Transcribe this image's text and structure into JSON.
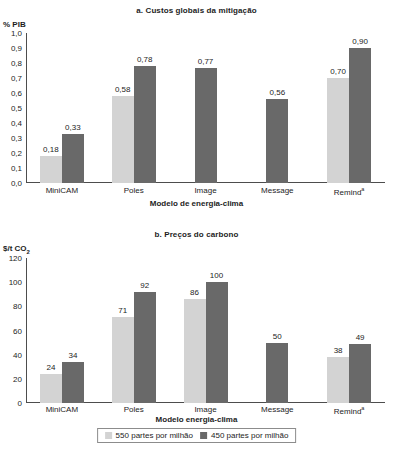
{
  "colors": {
    "series_550": "#d3d3d3",
    "series_450": "#696969",
    "axis": "#4d4d4d",
    "text": "#1d1d1d",
    "background": "#ffffff"
  },
  "legend": {
    "items": [
      {
        "label": "550 partes por milhão",
        "color": "#d3d3d3",
        "swatch": "light-gray-square-icon"
      },
      {
        "label": "450 partes por milhão",
        "color": "#696969",
        "swatch": "dark-gray-square-icon"
      }
    ]
  },
  "panel_a": {
    "title": "a. Custos globais da mitigação",
    "unit": "% PIB",
    "xlabel": "Modelo de energia-clima"
  },
  "panel_b": {
    "title": "b. Preços do carbono",
    "unit_prefix": "$/t CO",
    "unit_sub": "2",
    "xlabel": "Modelo energia-clima"
  },
  "chart_data": [
    {
      "id": "panel_a",
      "type": "bar",
      "title": "a. Custos globais da mitigação",
      "xlabel": "Modelo de energia-clima",
      "ylabel": "% PIB",
      "ylim": [
        0,
        1.0
      ],
      "yticks": [
        "0,0",
        "0,1",
        "0,2",
        "0,3",
        "0,4",
        "0,5",
        "0,6",
        "0,7",
        "0,8",
        "0,9",
        "1,0"
      ],
      "ytick_values": [
        0,
        0.1,
        0.2,
        0.3,
        0.4,
        0.5,
        0.6,
        0.7,
        0.8,
        0.9,
        1.0
      ],
      "grid": false,
      "legend_position": "bottom",
      "categories": [
        "MiniCAM",
        "Poles",
        "Image",
        "Message",
        "Remind"
      ],
      "category_footnotes": [
        "",
        "",
        "",
        "",
        "a"
      ],
      "series": [
        {
          "name": "550 partes por milhão",
          "color": "#d3d3d3",
          "values": [
            0.18,
            0.58,
            null,
            null,
            0.7
          ],
          "labels": [
            "0,18",
            "0,58",
            "",
            "",
            "0,70"
          ]
        },
        {
          "name": "450 partes por milhão",
          "color": "#696969",
          "values": [
            0.33,
            0.78,
            0.77,
            0.56,
            0.9
          ],
          "labels": [
            "0,33",
            "0,78",
            "0,77",
            "0,56",
            "0,90"
          ]
        }
      ]
    },
    {
      "id": "panel_b",
      "type": "bar",
      "title": "b. Preços do carbono",
      "xlabel": "Modelo energia-clima",
      "ylabel": "$/t CO2",
      "ylim": [
        0,
        120
      ],
      "yticks": [
        "0",
        "20",
        "40",
        "60",
        "80",
        "100",
        "120"
      ],
      "ytick_values": [
        0,
        20,
        40,
        60,
        80,
        100,
        120
      ],
      "grid": false,
      "legend_position": "bottom",
      "categories": [
        "MiniCAM",
        "Poles",
        "Image",
        "Message",
        "Remind"
      ],
      "category_footnotes": [
        "",
        "",
        "",
        "",
        "a"
      ],
      "series": [
        {
          "name": "550 partes por milhão",
          "color": "#d3d3d3",
          "values": [
            24,
            71,
            86,
            null,
            38
          ],
          "labels": [
            "24",
            "71",
            "86",
            "",
            "38"
          ]
        },
        {
          "name": "450 partes por milhão",
          "color": "#696969",
          "values": [
            34,
            92,
            100,
            50,
            49
          ],
          "labels": [
            "34",
            "92",
            "100",
            "50",
            "49"
          ]
        }
      ]
    }
  ]
}
